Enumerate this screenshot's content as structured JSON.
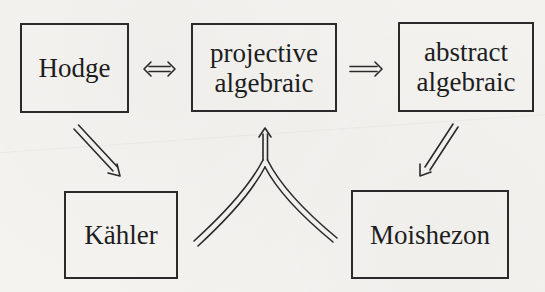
{
  "diagram": {
    "nodes": [
      {
        "id": "hodge",
        "label": "Hodge"
      },
      {
        "id": "projective_algebraic",
        "line1": "projective",
        "line2": "algebraic"
      },
      {
        "id": "abstract_algebraic",
        "line1": "abstract",
        "line2": "algebraic"
      },
      {
        "id": "kahler",
        "label": "Kähler"
      },
      {
        "id": "moishezon",
        "label": "Moishezon"
      }
    ],
    "edges": [
      {
        "from": "hodge",
        "to": "projective_algebraic",
        "type": "equivalence",
        "symbol": "⇔"
      },
      {
        "from": "projective_algebraic",
        "to": "abstract_algebraic",
        "type": "implication",
        "symbol": "⇒"
      },
      {
        "from": "hodge",
        "to": "kahler",
        "type": "implication",
        "symbol": "⇒"
      },
      {
        "from": "abstract_algebraic",
        "to": "moishezon",
        "type": "implication",
        "symbol": "⇒"
      },
      {
        "from": [
          "kahler",
          "moishezon"
        ],
        "to": "projective_algebraic",
        "type": "joint-implication",
        "symbol": "⇒"
      }
    ],
    "colors": {
      "ink": "#1d1d1d",
      "paper": "#f4f3f0"
    }
  }
}
